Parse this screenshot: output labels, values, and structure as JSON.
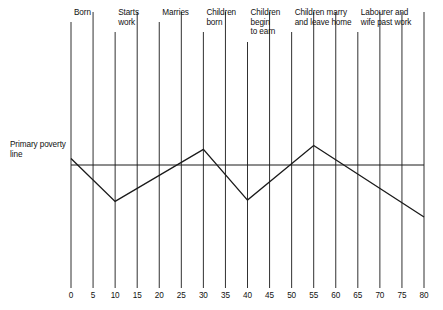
{
  "figure": {
    "background_color": "#ffffff",
    "line_color": "#1a1a1a",
    "poverty_line_label": "Primary poverty\nline"
  },
  "chart_data": {
    "type": "line",
    "title": "",
    "subtitle": "",
    "xlabel": "",
    "ylabel": "",
    "xlim": [
      0,
      80
    ],
    "ylim": [
      0,
      100
    ],
    "grid": false,
    "legend_position": "none",
    "x_ticks": [
      0,
      5,
      10,
      15,
      20,
      25,
      30,
      35,
      40,
      45,
      50,
      55,
      60,
      65,
      70,
      75,
      80
    ],
    "x_tick_labels": [
      "0",
      "5",
      "10",
      "15",
      "20",
      "25",
      "30",
      "35",
      "40",
      "45",
      "50",
      "55",
      "60",
      "65",
      "70",
      "75",
      "80"
    ],
    "y_ticks": [],
    "y_tick_labels": [],
    "series": [
      {
        "name": "Income relative to primary poverty line",
        "x": [
          0,
          10,
          30,
          40,
          55,
          80
        ],
        "values": [
          55,
          22,
          62,
          23,
          65,
          10
        ]
      },
      {
        "name": "Primary poverty line",
        "x": [
          0,
          80
        ],
        "values": [
          50,
          50
        ]
      }
    ],
    "annotations": [
      {
        "label": "Born",
        "x": 0,
        "lines": 1
      },
      {
        "label": "Starts\nwork",
        "x": 10,
        "lines": 2
      },
      {
        "label": "Marries",
        "x": 20,
        "lines": 1
      },
      {
        "label": "Children\nborn",
        "x": 30,
        "lines": 2
      },
      {
        "label": "Children\nbegin\nto earn",
        "x": 40,
        "lines": 3
      },
      {
        "label": "Children marry\nand leave home",
        "x": 50,
        "lines": 2
      },
      {
        "label": "Labourer and\nwife past work",
        "x": 65,
        "lines": 2
      }
    ],
    "vertical_markers": [
      0,
      5,
      10,
      15,
      20,
      25,
      30,
      35,
      40,
      45,
      50,
      55,
      60,
      65,
      70,
      75,
      80
    ]
  },
  "labels": {
    "poverty_caption": "Primary poverty\nline",
    "events": [
      "Born",
      "Starts\nwork",
      "Marries",
      "Children\nborn",
      "Children\nbegin\nto earn",
      "Children marry\nand leave home",
      "Labourer and\nwife past work"
    ],
    "ticks": [
      "0",
      "5",
      "10",
      "15",
      "20",
      "25",
      "30",
      "35",
      "40",
      "45",
      "50",
      "55",
      "60",
      "65",
      "70",
      "75",
      "80"
    ]
  }
}
